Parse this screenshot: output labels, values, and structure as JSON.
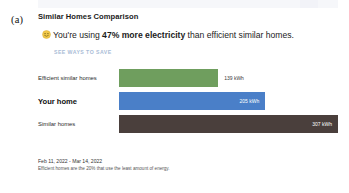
{
  "figure": {
    "label": "(a)"
  },
  "card": {
    "title": "Similar Homes Comparison",
    "emoji_name": "smiley-face-emoji",
    "headline": {
      "prefix": "You're using ",
      "emphasis": "47% more electricity",
      "suffix": " than efficient similar homes."
    },
    "save_link_label": "SEE WAYS TO SAVE"
  },
  "footer": {
    "date_range": "Feb 11, 2022 - Mar 14, 2022",
    "note": "Efficient homes are the 20% that use the least amount of energy."
  },
  "chart_data": {
    "type": "bar",
    "orientation": "horizontal",
    "title": "Similar Homes Comparison",
    "xlabel": "",
    "ylabel": "",
    "unit": "kWh",
    "xlim": [
      0,
      307
    ],
    "grid": false,
    "legend": "none",
    "categories": [
      "Efficient similar homes",
      "Your home",
      "Similar homes"
    ],
    "values": [
      139,
      205,
      307
    ],
    "value_labels": [
      "139 kWh",
      "205 kWh",
      "307 kWh"
    ],
    "label_placement": [
      "outside",
      "inside",
      "inside"
    ],
    "colors": [
      "#6f9e5e",
      "#4a7fc8",
      "#4a3f3c"
    ],
    "highlight_index": 1
  }
}
